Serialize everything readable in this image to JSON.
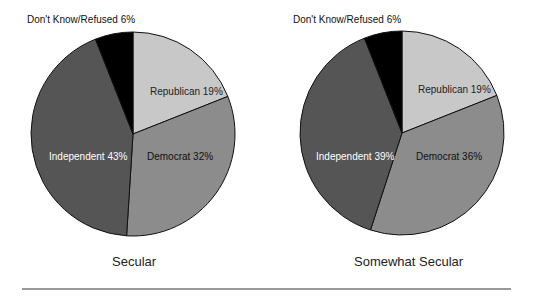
{
  "chart_data": [
    {
      "type": "pie",
      "title": "Secular",
      "categories": [
        "Republican",
        "Democrat",
        "Independent",
        "Don't Know/Refused"
      ],
      "values": [
        19,
        32,
        43,
        6
      ],
      "labels": [
        "Republican 19%",
        "Democrat 32%",
        "Independent 43%",
        "Don't Know/Refused 6%"
      ],
      "colors": [
        "#c8c8c8",
        "#8c8c8c",
        "#555555",
        "#000000"
      ],
      "start_angle": "12 o'clock, clockwise"
    },
    {
      "type": "pie",
      "title": "Somewhat Secular",
      "categories": [
        "Republican",
        "Democrat",
        "Independent",
        "Don't Know/Refused"
      ],
      "values": [
        19,
        36,
        39,
        6
      ],
      "labels": [
        "Republican 19%",
        "Democrat 36%",
        "Independent 39%",
        "Don't Know/Refused 6%"
      ],
      "colors": [
        "#c8c8c8",
        "#8c8c8c",
        "#555555",
        "#000000"
      ],
      "start_angle": "12 o'clock, clockwise"
    }
  ],
  "charts": [
    {
      "caption": "Secular",
      "republican": "Republican 19%",
      "democrat": "Democrat 32%",
      "independent": "Independent 43%",
      "dk": "Don't Know/Refused 6%"
    },
    {
      "caption": "Somewhat Secular",
      "republican": "Republican 19%",
      "democrat": "Democrat 36%",
      "independent": "Independent 39%",
      "dk": "Don't Know/Refused 6%"
    }
  ]
}
